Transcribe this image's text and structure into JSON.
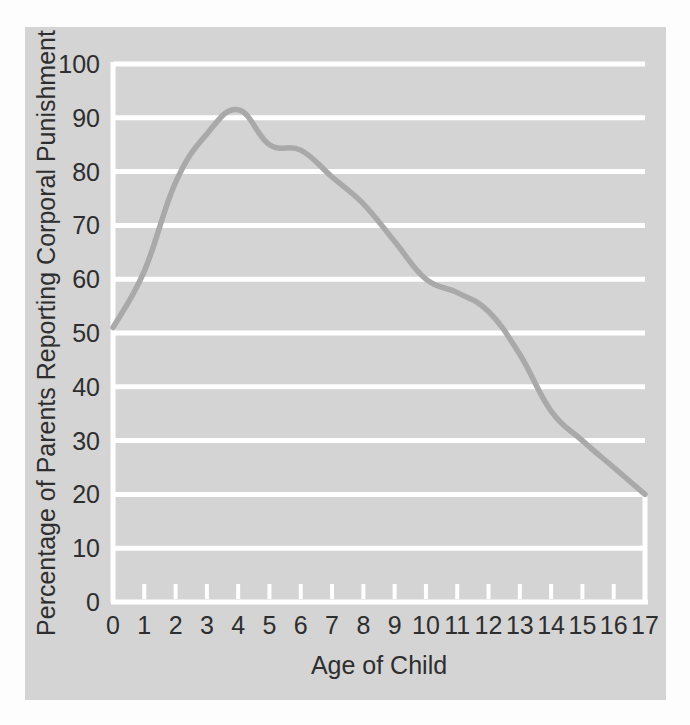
{
  "figure": {
    "background_color": "#fdfdfd",
    "panel_color": "#d4d4d4",
    "gridline_color": "#ffffff",
    "axis_color": "#ffffff",
    "line_color": "#a9a9a9",
    "text_color": "#2e2e2e"
  },
  "chart_data": {
    "type": "line",
    "title": "",
    "xlabel": "Age of Child",
    "ylabel": "Percentage of Parents Reporting Corporal Punishment",
    "xlim": [
      0,
      17
    ],
    "ylim": [
      0,
      100
    ],
    "grid": true,
    "legend": "none",
    "x_tick_labels": [
      "0",
      "1",
      "2",
      "3",
      "4",
      "5",
      "6",
      "7",
      "8",
      "9",
      "10",
      "11",
      "12",
      "13",
      "14",
      "15",
      "16",
      "17"
    ],
    "y_tick_labels": [
      "0",
      "10",
      "20",
      "30",
      "40",
      "50",
      "60",
      "70",
      "80",
      "90",
      "100"
    ],
    "x": [
      0,
      1,
      2,
      3,
      4,
      5,
      6,
      7,
      8,
      9,
      10,
      11,
      12,
      13,
      14,
      15,
      16,
      17
    ],
    "series": [
      {
        "name": "Percentage of Parents Reporting Corporal Punishment",
        "color": "#a9a9a9",
        "values": [
          51,
          61.5,
          78,
          87,
          91.5,
          85,
          84,
          79,
          74,
          67,
          60,
          57.5,
          54,
          46,
          35.5,
          30,
          25,
          20
        ]
      }
    ]
  }
}
